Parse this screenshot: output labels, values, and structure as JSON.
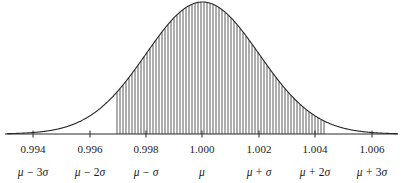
{
  "figure": {
    "title": "",
    "mu_symbol": "μ",
    "sigma_symbol": "σ"
  },
  "axis": {
    "line_color": "#2b2b2b",
    "x_start_px": 5,
    "x_end_px": 398,
    "baseline_y_px": 134,
    "tick_length_px": 7
  },
  "ticks": [
    {
      "value": 0.994,
      "label": "0.994",
      "x_px": 33,
      "sigma_label_parts": {
        "mu": "μ",
        "op": "−",
        "coef": "3",
        "sigma": "σ"
      }
    },
    {
      "value": 0.996,
      "label": "0.996",
      "x_px": 90,
      "sigma_label_parts": {
        "mu": "μ",
        "op": "−",
        "coef": "2",
        "sigma": "σ"
      }
    },
    {
      "value": 0.998,
      "label": "0.998",
      "x_px": 146,
      "sigma_label_parts": {
        "mu": "μ",
        "op": "−",
        "coef": "",
        "sigma": "σ"
      }
    },
    {
      "value": 1.0,
      "label": "1.000",
      "x_px": 202,
      "sigma_label_parts": {
        "mu": "μ",
        "op": "",
        "coef": "",
        "sigma": ""
      }
    },
    {
      "value": 1.002,
      "label": "1.002",
      "x_px": 259,
      "sigma_label_parts": {
        "mu": "μ",
        "op": "+",
        "coef": "",
        "sigma": "σ"
      }
    },
    {
      "value": 1.004,
      "label": "1.004",
      "x_px": 315,
      "sigma_label_parts": {
        "mu": "μ",
        "op": "+",
        "coef": "2",
        "sigma": "σ"
      }
    },
    {
      "value": 1.006,
      "label": "1.006",
      "x_px": 372,
      "sigma_label_parts": {
        "mu": "μ",
        "op": "+",
        "coef": "3",
        "sigma": "σ"
      }
    }
  ],
  "tick_label_row_y_px": 143,
  "sigma_label_row_y_px": 166,
  "chart_data": {
    "type": "area",
    "title": "",
    "subtitle": "",
    "xlabel": "",
    "ylabel": "",
    "distribution": "normal",
    "mu": 1.0,
    "sigma": 0.002,
    "xlim": [
      0.9931,
      1.0069
    ],
    "ylim": [
      0,
      1
    ],
    "grid": false,
    "legend": null,
    "curve_color": "#262626",
    "curve_width_px": 1.1,
    "hatch": {
      "style": "vertical-lines",
      "color": "#4a4a4a",
      "line_width_px": 0.9,
      "spacing_px": 3.0,
      "x_start_value": 0.997,
      "x_end_value": 1.00437,
      "x_start_px": 117,
      "x_end_px": 326
    },
    "x_tick_values": [
      0.994,
      0.996,
      0.998,
      1.0,
      1.002,
      1.004,
      1.006
    ],
    "x_tick_labels": [
      "0.994",
      "0.996",
      "0.998",
      "1.000",
      "1.002",
      "1.004",
      "1.006"
    ],
    "secondary_x_tick_labels": [
      "μ − 3σ",
      "μ − 2σ",
      "μ − σ",
      "μ",
      "μ + σ",
      "μ + 2σ",
      "μ + 3σ"
    ],
    "annotations": [],
    "x": [
      0.9931,
      0.994,
      0.9945,
      0.995,
      0.9955,
      0.996,
      0.9965,
      0.997,
      0.9975,
      0.998,
      0.9985,
      0.999,
      0.9995,
      1.0,
      1.0005,
      1.001,
      1.0015,
      1.002,
      1.0025,
      1.003,
      1.0035,
      1.004,
      1.0045,
      1.005,
      1.0055,
      1.006,
      1.0069
    ],
    "y": [
      0.0022,
      0.0111,
      0.0249,
      0.0439,
      0.0796,
      0.1353,
      0.2163,
      0.3247,
      0.4578,
      0.6065,
      0.7548,
      0.8825,
      0.9692,
      1.0,
      0.9692,
      0.8825,
      0.7548,
      0.6065,
      0.4578,
      0.3247,
      0.2163,
      0.1353,
      0.0796,
      0.0439,
      0.0249,
      0.0111,
      0.0022
    ]
  }
}
